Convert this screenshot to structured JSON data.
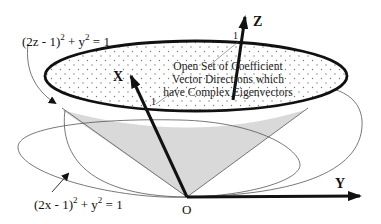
{
  "figure": {
    "type": "3d-axes-diagram",
    "colors": {
      "ink": "#111111",
      "cone_fill": "#d9d9d9",
      "dot_fill": "#777777",
      "thin_line": "#555555",
      "background": "#ffffff"
    }
  },
  "equations": {
    "top_left": {
      "base": "(2z - 1)",
      "exp1": "2",
      "mid": " + y",
      "exp2": "2",
      "rhs": " = 1"
    },
    "bottom_left": {
      "base": "(2x - 1)",
      "exp1": "2",
      "mid": " + y",
      "exp2": "2",
      "rhs": " = 1"
    }
  },
  "axes": {
    "x": {
      "label": "X",
      "tick": "1"
    },
    "y": {
      "label": "Y"
    },
    "z": {
      "label": "Z",
      "tick": "1"
    },
    "origin": {
      "label": "O"
    }
  },
  "region_label": {
    "line1": "Open Set of Coefficient",
    "line2": "Vector Directions which",
    "line3": "have Complex Eigenvectors"
  }
}
